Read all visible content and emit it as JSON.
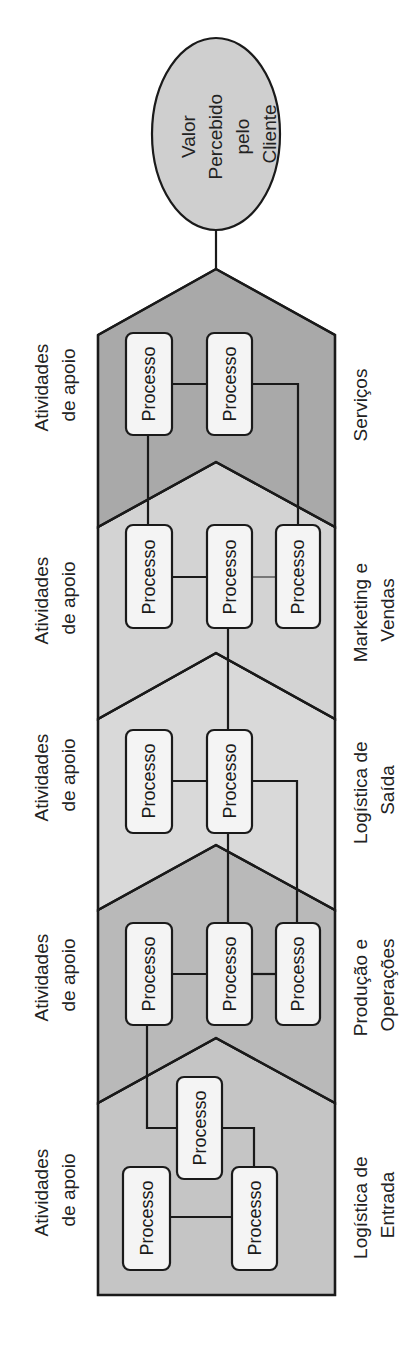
{
  "diagram": {
    "type": "value-chain",
    "orientation": "rotated -90deg (read bottom to top)",
    "goal": {
      "label_lines": [
        "Valor",
        "Percebido",
        "pelo",
        "Cliente"
      ],
      "color": "#cfcfcf"
    },
    "stages": [
      {
        "name_lines": [
          "Serviços"
        ],
        "support_lines": [
          "Atividades",
          "de apoio"
        ],
        "color": "#a9a9a9",
        "processes": [
          "Processo",
          "Processo"
        ]
      },
      {
        "name_lines": [
          "Marketing e",
          "Vendas"
        ],
        "support_lines": [
          "Atividades",
          "de apoio"
        ],
        "color": "#d3d3d3",
        "processes": [
          "Processo",
          "Processo",
          "Processo"
        ]
      },
      {
        "name_lines": [
          "Logística de",
          "Saída"
        ],
        "support_lines": [
          "Atividades",
          "de apoio"
        ],
        "color": "#d9d9d9",
        "processes": [
          "Processo",
          "Processo"
        ]
      },
      {
        "name_lines": [
          "Produção e",
          "Operações"
        ],
        "support_lines": [
          "Atividades",
          "de apoio"
        ],
        "color": "#b9b9b9",
        "processes": [
          "Processo",
          "Processo",
          "Processo"
        ]
      },
      {
        "name_lines": [
          "Logística de",
          "Entrada"
        ],
        "support_lines": [
          "Atividades",
          "de apoio"
        ],
        "color": "#c5c5c5",
        "processes": [
          "Processo",
          "Processo",
          "Processo"
        ]
      }
    ]
  }
}
